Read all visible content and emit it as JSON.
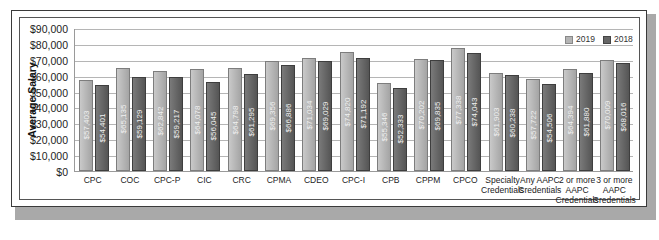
{
  "chart_data": {
    "type": "bar",
    "title": "",
    "xlabel": "",
    "ylabel": "Average Salary",
    "ylim": [
      0,
      90000
    ],
    "yticks": [
      "$90,000",
      "$80,000",
      "$70,000",
      "$60,000",
      "$50,000",
      "$40,000",
      "$30,000",
      "$20,000",
      "$10,000",
      "$0"
    ],
    "grid": true,
    "legend_position": "top-right",
    "categories": [
      "CPC",
      "COC",
      "CPC-P",
      "CIC",
      "CRC",
      "CPMA",
      "CDEO",
      "CPC-I",
      "CPB",
      "CPPM",
      "CPCO",
      "Specialty Credentials",
      "Any AAPC Credentials",
      "2 or more AAPC Credentials",
      "3 or more AAPC Credentials"
    ],
    "series": [
      {
        "name": "2019",
        "color": "#b4b4b4",
        "values": [
          57403,
          65135,
          62842,
          64078,
          64798,
          69356,
          71034,
          74820,
          55346,
          70202,
          77338,
          61903,
          57722,
          64394,
          70009
        ],
        "labels": [
          "$57,403",
          "$65,135",
          "$62,842",
          "$64,078",
          "$64,798",
          "$69,356",
          "$71,034",
          "$74,820",
          "$55,346",
          "$70,202",
          "$77,338",
          "$61,903",
          "$57,722",
          "$64,394",
          "$70,009"
        ]
      },
      {
        "name": "2018",
        "color": "#666666",
        "values": [
          54401,
          59129,
          59217,
          56045,
          61295,
          66886,
          69029,
          71192,
          52333,
          69835,
          74043,
          60238,
          54506,
          61880,
          68016
        ],
        "labels": [
          "$54,401",
          "$59,129",
          "$59,217",
          "$56,045",
          "$61,295",
          "$66,886",
          "$69,029",
          "$71,192",
          "$52,333",
          "$69,835",
          "$74,043",
          "$60,238",
          "$54,506",
          "$61,880",
          "$68,016"
        ]
      }
    ]
  },
  "legend": {
    "items": [
      "2019",
      "2018"
    ]
  },
  "xlabels_display": [
    "CPC",
    "COC",
    "CPC-P",
    "CIC",
    "CRC",
    "CPMA",
    "CDEO",
    "CPC-I",
    "CPB",
    "CPPM",
    "CPCO",
    "Specialty\nCredentials",
    "Any AAPC\nCredentials",
    "2 or more\nAAPC\nCredentials",
    "3 or more\nAAPC\nCredentials"
  ]
}
